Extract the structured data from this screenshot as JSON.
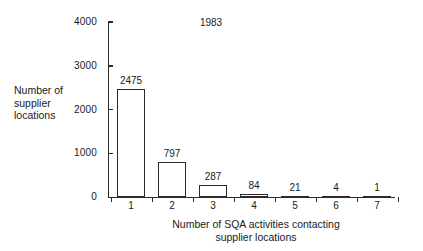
{
  "chart_data": {
    "type": "bar",
    "title": "",
    "annotation": "1983",
    "xlabel": "Number of SQA activities contacting supplier locations",
    "xlabel_line1": "Number of SQA activities contacting",
    "xlabel_line2": "supplier locations",
    "ylabel": "Number of supplier locations",
    "ylabel_line1": "Number of",
    "ylabel_line2": "supplier",
    "ylabel_line3": "locations",
    "categories": [
      "1",
      "2",
      "3",
      "4",
      "5",
      "6",
      "7"
    ],
    "values": [
      2475,
      797,
      287,
      84,
      21,
      4,
      1
    ],
    "value_labels": [
      "2475",
      "797",
      "287",
      "84",
      "21",
      "4",
      "1"
    ],
    "ylim": [
      0,
      4000
    ],
    "ytick_labels": [
      "0",
      "1000",
      "2000",
      "3000",
      "4000"
    ],
    "ytick_values": [
      0,
      1000,
      2000,
      3000,
      4000
    ],
    "grid": false,
    "legend": false,
    "bar_fill_color": "#ffffff",
    "bar_edge_color": "#2b2b2b",
    "axis_color": "#2b2b2b",
    "background_color": "#ffffff"
  }
}
